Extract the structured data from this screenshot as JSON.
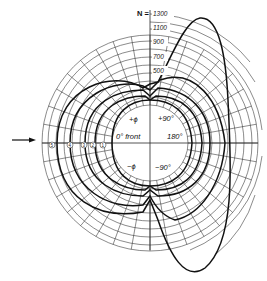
{
  "diagram": {
    "type": "polar-diagram",
    "scale_label": "N =",
    "scale_ticks": [
      "1300",
      "1100",
      "900",
      "700",
      "500"
    ],
    "angle_labels": {
      "front": "0° front",
      "back": "180°",
      "plus": "+90°",
      "minus": "−90°",
      "phi_plus": "+ϕ",
      "phi_minus": "−ϕ"
    },
    "curve_labels": [
      "5",
      "4",
      "3",
      "2",
      "1"
    ],
    "arrow": "incident-direction-arrow",
    "colors": {
      "ink": "#111111",
      "background": "#ffffff"
    }
  }
}
